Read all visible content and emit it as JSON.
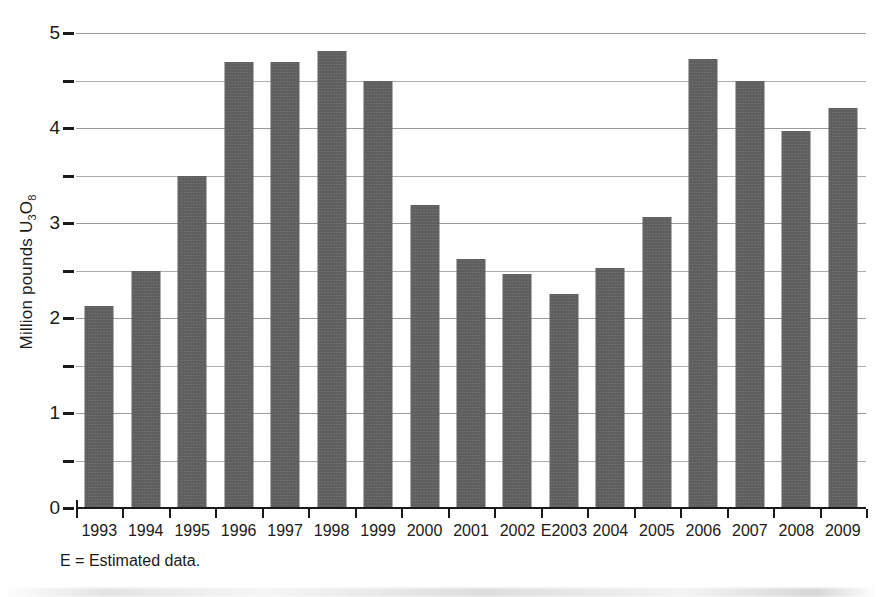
{
  "chart_data": {
    "type": "bar",
    "title": "",
    "xlabel": "",
    "ylabel": "Million pounds U3O8",
    "ylabel_parts": {
      "prefix": "Million pounds U",
      "sub1": "3",
      "mid": "O",
      "sub2": "8"
    },
    "categories": [
      "1993",
      "1994",
      "1995",
      "1996",
      "1997",
      "1998",
      "1999",
      "2000",
      "2001",
      "2002",
      "E2003",
      "2004",
      "2005",
      "2006",
      "2007",
      "2008",
      "2009"
    ],
    "values": [
      2.13,
      2.5,
      3.49,
      4.7,
      4.7,
      4.81,
      4.5,
      3.19,
      2.62,
      2.46,
      2.25,
      2.53,
      3.06,
      4.73,
      4.49,
      3.97,
      4.21
    ],
    "ylim": [
      0,
      5
    ],
    "y_major_ticks": [
      0,
      1,
      2,
      3,
      4,
      5
    ],
    "y_minor_ticks": [
      0.5,
      1.5,
      2.5,
      3.5,
      4.5
    ],
    "y_tick_labels": [
      "0",
      "1",
      "2",
      "3",
      "4",
      "5"
    ],
    "grid": true,
    "legend": "none",
    "bar_color": "#5f5f5f",
    "grid_color": "#adadad",
    "axis_color": "#1a1a1a"
  },
  "footnote": "E = Estimated data."
}
